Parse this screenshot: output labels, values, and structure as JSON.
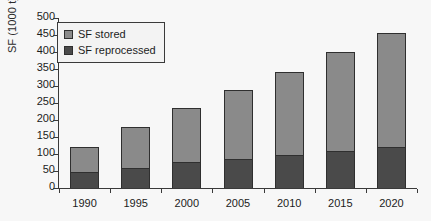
{
  "chart_data": {
    "type": "bar",
    "subtype": "stacked-vertical",
    "title": "",
    "subtitle": "",
    "xlabel": "",
    "ylabel": "SF (1000 t)",
    "categories": [
      "1990",
      "1995",
      "2000",
      "2005",
      "2010",
      "2015",
      "2020"
    ],
    "series": [
      {
        "name": "SF reprocessed",
        "color": "#4a4a4a",
        "values": [
          48,
          60,
          76,
          85,
          96,
          110,
          122
        ]
      },
      {
        "name": "SF stored",
        "color": "#8a8a8a",
        "values": [
          73,
          119,
          159,
          203,
          245,
          290,
          335
        ]
      }
    ],
    "totals": [
      121,
      179,
      235,
      288,
      341,
      400,
      457
    ],
    "stack_order": [
      "SF reprocessed",
      "SF stored"
    ],
    "ylim": [
      0,
      500
    ],
    "ytick_step": 50,
    "ytick_labels": [
      "500",
      "450",
      "400",
      "350",
      "300",
      "250",
      "200",
      "150",
      "100",
      "50",
      "0"
    ],
    "ytick_values": [
      500,
      450,
      400,
      350,
      300,
      250,
      200,
      150,
      100,
      50,
      0
    ],
    "grid": false,
    "legend_position": "upper-left",
    "legend_boxed": true,
    "legend": [
      {
        "label": "SF stored",
        "color": "#8a8a8a",
        "swatch": "stored"
      },
      {
        "label": "SF reprocessed",
        "color": "#4a4a4a",
        "swatch": "repro"
      }
    ],
    "annotations": [],
    "background_color": "#f7f7f7",
    "axis_color": "#3a3a3a"
  }
}
